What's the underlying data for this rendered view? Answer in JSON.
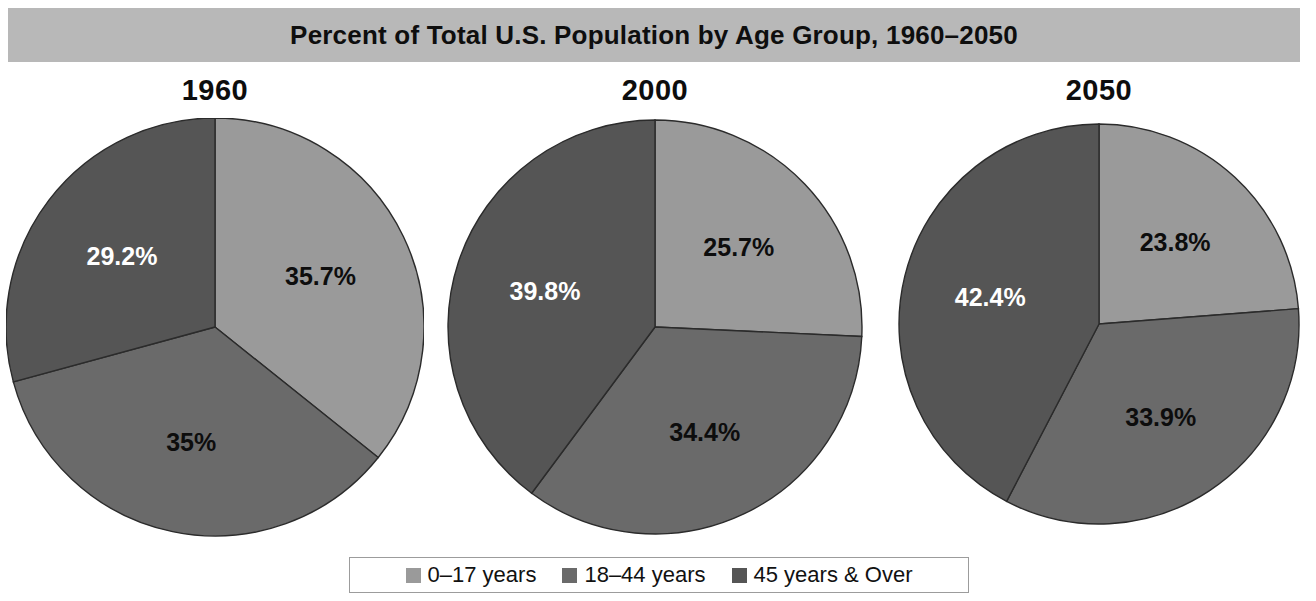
{
  "title": "Percent of Total U.S. Population by Age Group, 1960–2050",
  "colors": {
    "title_bar_bg": "#b8b8b8",
    "age_0_17": "#9a9a9a",
    "age_18_44": "#6a6a6a",
    "age_45_over": "#555555",
    "slice_outline": "#2b2b2b",
    "label_dark": "#0d0d0d",
    "label_light": "#ffffff"
  },
  "legend": {
    "items": [
      {
        "label": "0–17 years",
        "color": "#9a9a9a",
        "swatch_icon": "square-swatch-icon"
      },
      {
        "label": "18–44 years",
        "color": "#6a6a6a",
        "swatch_icon": "square-swatch-icon"
      },
      {
        "label": "45 years & Over",
        "color": "#555555",
        "swatch_icon": "square-swatch-icon"
      }
    ]
  },
  "chart_data": {
    "type": "pie",
    "title": "Percent of Total U.S. Population by Age Group, 1960–2050",
    "unit": "percent",
    "legend_position": "bottom",
    "categories": [
      "0–17 years",
      "18–44 years",
      "45 years & Over"
    ],
    "charts": [
      {
        "title": "1960",
        "labels": [
          "35.7%",
          "35%",
          "29.2%"
        ],
        "values": [
          35.7,
          35.0,
          29.2
        ],
        "label_colors": [
          "#0d0d0d",
          "#0d0d0d",
          "#ffffff"
        ]
      },
      {
        "title": "2000",
        "labels": [
          "25.7%",
          "34.4%",
          "39.8%"
        ],
        "values": [
          25.7,
          34.4,
          39.8
        ],
        "label_colors": [
          "#0d0d0d",
          "#0d0d0d",
          "#ffffff"
        ]
      },
      {
        "title": "2050",
        "labels": [
          "23.8%",
          "33.9%",
          "42.4%"
        ],
        "values": [
          23.8,
          33.9,
          42.4
        ],
        "label_colors": [
          "#0d0d0d",
          "#0d0d0d",
          "#ffffff"
        ]
      }
    ]
  }
}
